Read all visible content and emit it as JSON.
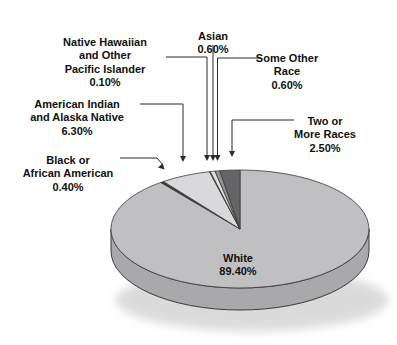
{
  "figure": {
    "background": "#ffffff"
  },
  "chart_data": {
    "type": "pie",
    "effect": "3d",
    "title": "",
    "legend": "none",
    "start_angle_deg": 0,
    "direction": "clockwise",
    "categories": [
      "White",
      "Black or African American",
      "American Indian and Alaska Native",
      "Native Hawaiian and Other Pacific Islander",
      "Asian",
      "Some Other Race",
      "Two or More Races"
    ],
    "values": [
      89.4,
      0.4,
      6.3,
      0.1,
      0.6,
      0.6,
      2.5
    ],
    "value_labels": [
      "89.40%",
      "0.40%",
      "6.30%",
      "0.10%",
      "0.60%",
      "0.60%",
      "2.50%"
    ],
    "slugs": [
      "white",
      "black-or-african-american",
      "american-indian-alaska-native",
      "native-hawaiian-pacific-islander",
      "asian",
      "some-other-race",
      "two-or-more-races"
    ],
    "colors": [
      "#c0c0c2",
      "#3d3d3f",
      "#d9d9db",
      "#6f6f71",
      "#dfdfe1",
      "#909092",
      "#656567"
    ],
    "rim_color": "#a9a9ab",
    "outline_color": "#3a3a3a",
    "leader_color": "#2b2b2b",
    "text_color": "#111111"
  },
  "callouts": {
    "nhpi": {
      "text": "Native Hawaiian\nand Other\nPacific Islander",
      "value": "0.10%"
    },
    "asian": {
      "text": "Asian",
      "value": "0.60%"
    },
    "sor": {
      "text": "Some Other\nRace",
      "value": "0.60%"
    },
    "aian": {
      "text": "American Indian\nand Alaska Native",
      "value": "6.30%"
    },
    "two": {
      "text": "Two or\nMore Races",
      "value": "2.50%"
    },
    "black": {
      "text": "Black or\nAfrican American",
      "value": "0.40%"
    },
    "white": {
      "text": "White",
      "value": "89.40%"
    }
  }
}
